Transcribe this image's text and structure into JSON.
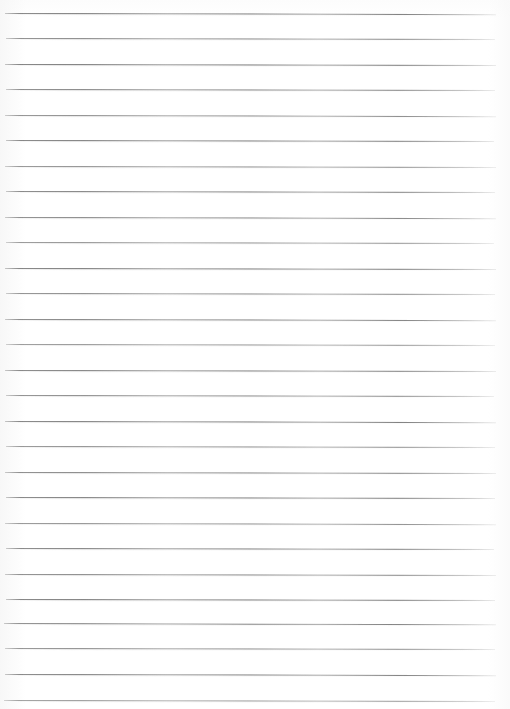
{
  "document": {
    "kind": "scanned-lined-paper",
    "title": "Lined paper scan",
    "description": "A blank sheet of ruled notebook paper, scanned. No handwriting, no printed text, no headings, no page numbers.",
    "page_width_px": 510,
    "page_height_px": 709,
    "background_color": "#ffffff",
    "rule_color": "#6e6e6e",
    "rule_color_light": "#b4b4b4",
    "rule_count": 28,
    "rule_spacing_px": 25.5,
    "first_rule_y_px": 12.5,
    "rule_left_x_px": 5,
    "rule_right_x_px": 496,
    "rule_thickness_px": 1,
    "rule_slant_deg": 0.12,
    "has_margin_line": false,
    "has_holes": false,
    "text_content": ""
  },
  "rules": [
    {
      "y": 12.5,
      "left": 5,
      "right": 496,
      "opacity": 0.92,
      "slant": 0.14
    },
    {
      "y": 38.0,
      "left": 6,
      "right": 495,
      "opacity": 0.85,
      "slant": 0.12
    },
    {
      "y": 63.5,
      "left": 5,
      "right": 496,
      "opacity": 0.95,
      "slant": 0.13
    },
    {
      "y": 89.0,
      "left": 6,
      "right": 495,
      "opacity": 0.88,
      "slant": 0.11
    },
    {
      "y": 114.5,
      "left": 5,
      "right": 496,
      "opacity": 0.82,
      "slant": 0.14
    },
    {
      "y": 140.0,
      "left": 6,
      "right": 494,
      "opacity": 0.93,
      "slant": 0.12
    },
    {
      "y": 165.5,
      "left": 5,
      "right": 496,
      "opacity": 0.8,
      "slant": 0.13
    },
    {
      "y": 191.0,
      "left": 6,
      "right": 495,
      "opacity": 0.9,
      "slant": 0.12
    },
    {
      "y": 216.5,
      "left": 5,
      "right": 496,
      "opacity": 0.86,
      "slant": 0.14
    },
    {
      "y": 242.0,
      "left": 6,
      "right": 494,
      "opacity": 0.78,
      "slant": 0.11
    },
    {
      "y": 267.5,
      "left": 5,
      "right": 496,
      "opacity": 0.94,
      "slant": 0.13
    },
    {
      "y": 293.0,
      "left": 6,
      "right": 495,
      "opacity": 0.83,
      "slant": 0.12
    },
    {
      "y": 318.5,
      "left": 5,
      "right": 496,
      "opacity": 0.89,
      "slant": 0.14
    },
    {
      "y": 344.0,
      "left": 6,
      "right": 495,
      "opacity": 0.76,
      "slant": 0.12
    },
    {
      "y": 369.5,
      "left": 5,
      "right": 496,
      "opacity": 0.91,
      "slant": 0.13
    },
    {
      "y": 395.0,
      "left": 6,
      "right": 494,
      "opacity": 0.84,
      "slant": 0.11
    },
    {
      "y": 420.5,
      "left": 5,
      "right": 496,
      "opacity": 0.93,
      "slant": 0.14
    },
    {
      "y": 446.0,
      "left": 6,
      "right": 495,
      "opacity": 0.8,
      "slant": 0.12
    },
    {
      "y": 471.5,
      "left": 5,
      "right": 496,
      "opacity": 0.87,
      "slant": 0.13
    },
    {
      "y": 497.0,
      "left": 6,
      "right": 495,
      "opacity": 0.92,
      "slant": 0.12
    },
    {
      "y": 522.5,
      "left": 5,
      "right": 496,
      "opacity": 0.79,
      "slant": 0.14
    },
    {
      "y": 548.0,
      "left": 6,
      "right": 494,
      "opacity": 0.9,
      "slant": 0.11
    },
    {
      "y": 573.5,
      "left": 5,
      "right": 496,
      "opacity": 0.85,
      "slant": 0.13
    },
    {
      "y": 599.0,
      "left": 6,
      "right": 495,
      "opacity": 0.94,
      "slant": 0.12
    },
    {
      "y": 622.5,
      "left": 4,
      "right": 496,
      "opacity": 0.88,
      "slant": 0.16
    },
    {
      "y": 648.0,
      "left": 5,
      "right": 495,
      "opacity": 0.81,
      "slant": 0.13
    },
    {
      "y": 673.5,
      "left": 5,
      "right": 496,
      "opacity": 0.9,
      "slant": 0.14
    },
    {
      "y": 700.0,
      "left": 4,
      "right": 495,
      "opacity": 0.72,
      "slant": 0.12
    }
  ]
}
